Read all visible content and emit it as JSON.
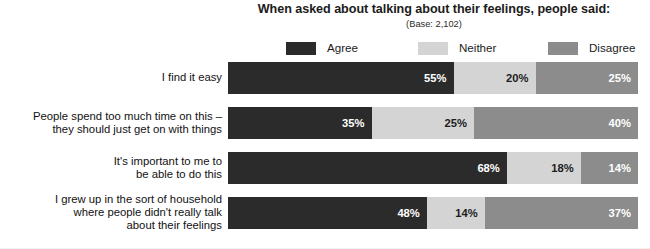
{
  "header": {
    "title": "When asked about talking about their feelings, people said:",
    "subtitle": "(Base: 2,102)"
  },
  "legend": {
    "items": [
      {
        "label": "Agree",
        "color": "#2b2b2b"
      },
      {
        "label": "Neither",
        "color": "#d4d4d4"
      },
      {
        "label": "Disagree",
        "color": "#8c8c8c"
      }
    ]
  },
  "chart_data": {
    "type": "bar",
    "orientation": "horizontal",
    "stacked": true,
    "title": "When asked about talking about their feelings, people said:",
    "subtitle": "(Base: 2,102)",
    "xlabel": "",
    "ylabel": "",
    "xlim": [
      0,
      100
    ],
    "grid": false,
    "legend_position": "top",
    "value_suffix": "%",
    "categories": [
      "I find it easy",
      "People spend too much time on this –\nthey should just get on with things",
      "It's important to me to\nbe able to do this",
      "I grew up in the sort of household\nwhere people didn't really talk\nabout their feelings"
    ],
    "series": [
      {
        "name": "Agree",
        "color": "#2b2b2b",
        "values": [
          55,
          35,
          68,
          48
        ]
      },
      {
        "name": "Neither",
        "color": "#d4d4d4",
        "values": [
          20,
          25,
          18,
          14
        ]
      },
      {
        "name": "Disagree",
        "color": "#8c8c8c",
        "values": [
          25,
          40,
          14,
          37
        ]
      }
    ]
  },
  "rows": [
    {
      "label": "I find it easy",
      "label_lines": 1,
      "segments": [
        {
          "name": "Agree",
          "value": 55,
          "text": "55%"
        },
        {
          "name": "Neither",
          "value": 20,
          "text": "20%"
        },
        {
          "name": "Disagree",
          "value": 25,
          "text": "25%"
        }
      ]
    },
    {
      "label": "People spend too much time on this –\nthey should just get on with things",
      "label_lines": 2,
      "segments": [
        {
          "name": "Agree",
          "value": 35,
          "text": "35%"
        },
        {
          "name": "Neither",
          "value": 25,
          "text": "25%"
        },
        {
          "name": "Disagree",
          "value": 40,
          "text": "40%"
        }
      ]
    },
    {
      "label": "It's important to me to\nbe able to do this",
      "label_lines": 2,
      "segments": [
        {
          "name": "Agree",
          "value": 68,
          "text": "68%"
        },
        {
          "name": "Neither",
          "value": 18,
          "text": "18%"
        },
        {
          "name": "Disagree",
          "value": 14,
          "text": "14%"
        }
      ]
    },
    {
      "label": "I grew up in the sort of household\nwhere people didn't really talk\nabout their feelings",
      "label_lines": 3,
      "segments": [
        {
          "name": "Agree",
          "value": 48,
          "text": "48%"
        },
        {
          "name": "Neither",
          "value": 14,
          "text": "14%"
        },
        {
          "name": "Disagree",
          "value": 37,
          "text": "37%"
        }
      ]
    }
  ]
}
